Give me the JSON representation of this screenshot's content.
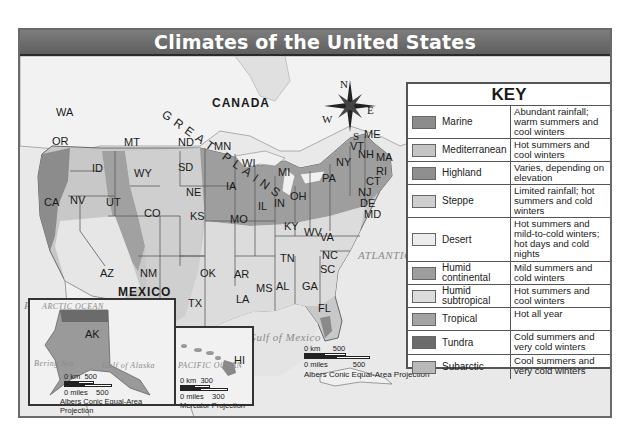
{
  "title": "Climates of the United States",
  "labels": {
    "countries": [
      {
        "id": "canada",
        "text": "CANADA"
      },
      {
        "id": "mexico",
        "text": "MEXICO"
      }
    ],
    "oceans": [
      {
        "id": "pacific",
        "text": "PACIFIC OCEAN"
      },
      {
        "id": "atlantic",
        "text": "ATLANTIC OCEAN"
      },
      {
        "id": "gulf",
        "text": "Gulf of Mexico"
      },
      {
        "id": "arctic",
        "text": "ARCTIC OCEAN"
      },
      {
        "id": "bering",
        "text": "Bering Sea"
      },
      {
        "id": "alaska_gulf",
        "text": "Gulf of Alaska"
      },
      {
        "id": "pacific_hi",
        "text": "PACIFIC OCEAN"
      }
    ],
    "region": "GREAT PLAINS",
    "compass": {
      "n": "N",
      "s": "S",
      "e": "E",
      "w": "W"
    },
    "states": [
      "WA",
      "OR",
      "CA",
      "NV",
      "ID",
      "MT",
      "WY",
      "UT",
      "AZ",
      "CO",
      "NM",
      "ND",
      "SD",
      "NE",
      "KS",
      "OK",
      "TX",
      "MN",
      "IA",
      "MO",
      "AR",
      "LA",
      "WI",
      "IL",
      "MI",
      "IN",
      "OH",
      "KY",
      "TN",
      "MS",
      "AL",
      "GA",
      "FL",
      "SC",
      "NC",
      "VA",
      "WV",
      "PA",
      "NY",
      "VT",
      "NH",
      "ME",
      "MA",
      "RI",
      "CT",
      "NJ",
      "DE",
      "MD",
      "AK",
      "HI"
    ]
  },
  "key": {
    "title": "KEY",
    "items": [
      {
        "name": "Marine",
        "desc": "Abundant rainfall; warm summers and cool winters",
        "color": "#8c8c8c"
      },
      {
        "name": "Mediterranean",
        "desc": "Hot summers and cool winters",
        "color": "#c4c4c4"
      },
      {
        "name": "Highland",
        "desc": "Varies, depending on elevation",
        "color": "#8f8f8f"
      },
      {
        "name": "Steppe",
        "desc": "Limited rainfall; hot summers and cold winters",
        "color": "#cfcfcf"
      },
      {
        "name": "Desert",
        "desc": "Hot summers and mild-to-cold winters; hot days and cold nights",
        "color": "#ececec"
      },
      {
        "name": "Humid continental",
        "desc": "Mild summers and cold winters",
        "color": "#9e9e9e"
      },
      {
        "name": "Humid subtropical",
        "desc": "Hot summers and cool winters",
        "color": "#dcdcdc"
      },
      {
        "name": "Tropical",
        "desc": "Hot all year",
        "color": "#a3a3a3"
      },
      {
        "name": "Tundra",
        "desc": "Cold summers and very cold winters",
        "color": "#6b6b6b"
      },
      {
        "name": "Subarctic",
        "desc": "Cool summers and very cold winters",
        "color": "#b9b9b9"
      }
    ]
  },
  "scales": {
    "main": {
      "km_label": "0 km",
      "km_value": "500",
      "mi_label": "0 miles",
      "mi_value": "500",
      "projection": "Albers Conic Equal-Area Projection"
    },
    "alaska": {
      "km_label": "0 km",
      "km_value": "500",
      "mi_label": "0 miles",
      "mi_value": "500",
      "projection": "Albers Conic Equal-Area Projection"
    },
    "hawaii": {
      "km_label": "0 km",
      "km_value": "300",
      "mi_label": "0 miles",
      "mi_value": "300",
      "projection": "Mercator Projection"
    }
  }
}
